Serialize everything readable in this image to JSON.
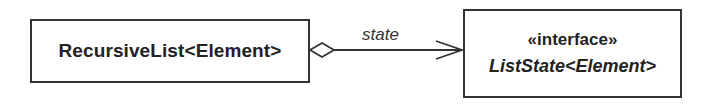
{
  "diagram": {
    "type": "UML class diagram",
    "classes": [
      {
        "id": "recursive-list",
        "name": "RecursiveList<Element>",
        "stereotype": null,
        "italic": false
      },
      {
        "id": "list-state",
        "name": "ListState<Element>",
        "stereotype": "«interface»",
        "italic": true
      }
    ],
    "relationships": [
      {
        "from": "recursive-list",
        "to": "list-state",
        "kind": "aggregation",
        "navigable": true,
        "label": "state"
      }
    ]
  },
  "colors": {
    "line": "#333333",
    "background": "#ffffff",
    "text": "#222222"
  }
}
